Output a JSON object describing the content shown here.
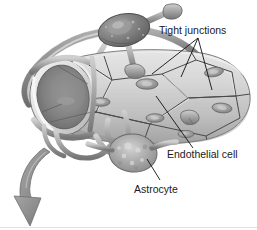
{
  "figure": {
    "background_color": "#ffffff",
    "width": 257,
    "height": 230
  },
  "labels": {
    "tight_junctions": "Tight junctions",
    "endothelial_cell": "Endothelial cell",
    "astrocyte": "Astrocyte"
  },
  "structures": {
    "capillary_label": "capillary-tube",
    "lumen_label": "capillary-lumen",
    "astrocyte_top_label": "astrocyte-upper",
    "astrocyte_bottom_label": "astrocyte-lower",
    "arrow_label": "direction-arrow"
  },
  "colors": {
    "label_text": "#1a1a1a",
    "leader_line": "#111111",
    "tube_light": "#dcdcdc",
    "tube_mid": "#c3c3c3",
    "tube_shadow": "#9a9a9a",
    "lumen_dark": "#6f6f6f",
    "astrocyte_dark": "#6b6b6b",
    "astrocyte_light": "#b9b9b9",
    "arrow_gray": "#8e8e8e",
    "outline": "#5a5a5a",
    "rim_light": "#eeeeee"
  }
}
